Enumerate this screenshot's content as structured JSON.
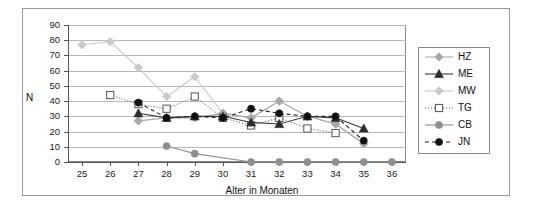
{
  "chart_data": {
    "type": "line",
    "title": "",
    "xlabel": "Alter in Monaten",
    "ylabel": "N",
    "x": [
      25,
      26,
      27,
      28,
      29,
      30,
      31,
      32,
      33,
      34,
      35,
      36
    ],
    "xlim": [
      24.5,
      36.5
    ],
    "ylim": [
      0,
      90
    ],
    "yticks": [
      0,
      10,
      20,
      30,
      40,
      50,
      60,
      70,
      80,
      90
    ],
    "xticks": [
      25,
      26,
      27,
      28,
      29,
      30,
      31,
      32,
      33,
      34,
      35,
      36
    ],
    "grid": "horizontal",
    "legend_position": "right",
    "series": [
      {
        "name": "HZ",
        "color": "#a8a8a8",
        "marker": "diamond",
        "marker_fill": "#a8a8a8",
        "line": "solid",
        "points": [
          {
            "x": 27,
            "y": 27
          },
          {
            "x": 28,
            "y": 29
          },
          {
            "x": 29,
            "y": 29
          },
          {
            "x": 30,
            "y": 32
          },
          {
            "x": 31,
            "y": 29
          },
          {
            "x": 32,
            "y": 40
          },
          {
            "x": 33,
            "y": 30
          },
          {
            "x": 34,
            "y": 25
          },
          {
            "x": 35,
            "y": 12
          }
        ]
      },
      {
        "name": "ME",
        "color": "#3a3a3a",
        "marker": "triangle",
        "marker_fill": "#2b2b2b",
        "line": "solid",
        "points": [
          {
            "x": 27,
            "y": 32
          },
          {
            "x": 28,
            "y": 29
          },
          {
            "x": 29,
            "y": 30
          },
          {
            "x": 30,
            "y": 30
          },
          {
            "x": 31,
            "y": 26
          },
          {
            "x": 32,
            "y": 25
          },
          {
            "x": 33,
            "y": 30
          },
          {
            "x": 34,
            "y": 29
          },
          {
            "x": 35,
            "y": 22
          }
        ]
      },
      {
        "name": "MW",
        "color": "#c9c9c9",
        "marker": "diamond",
        "marker_fill": "#c9c9c9",
        "line": "solid",
        "points": [
          {
            "x": 25,
            "y": 77
          },
          {
            "x": 26,
            "y": 79
          },
          {
            "x": 27,
            "y": 62
          },
          {
            "x": 28,
            "y": 43
          },
          {
            "x": 29,
            "y": 56
          },
          {
            "x": 30,
            "y": 32
          },
          {
            "x": 31,
            "y": 29
          },
          {
            "x": 32,
            "y": 40
          },
          {
            "x": 33,
            "y": 30
          },
          {
            "x": 34,
            "y": 25
          },
          {
            "x": 35,
            "y": 12
          }
        ]
      },
      {
        "name": "TG",
        "color": "#555555",
        "marker": "square-open",
        "marker_fill": "#ffffff",
        "line": "dotted",
        "points": [
          {
            "x": 26,
            "y": 44
          },
          {
            "x": 27,
            "y": 38
          },
          {
            "x": 28,
            "y": 35
          },
          {
            "x": 29,
            "y": 43
          },
          {
            "x": 30,
            "y": 29
          },
          {
            "x": 31,
            "y": 24
          },
          {
            "x": 32,
            "y": 29
          },
          {
            "x": 33,
            "y": 22
          },
          {
            "x": 34,
            "y": 19
          }
        ]
      },
      {
        "name": "CB",
        "color": "#8f8f8f",
        "marker": "circle",
        "marker_fill": "#8f8f8f",
        "line": "solid",
        "points": [
          {
            "x": 28,
            "y": 10.5
          },
          {
            "x": 29,
            "y": 5.5
          },
          {
            "x": 31,
            "y": 0
          },
          {
            "x": 32,
            "y": 0
          },
          {
            "x": 33,
            "y": 0
          },
          {
            "x": 34,
            "y": 0
          },
          {
            "x": 35,
            "y": 0
          },
          {
            "x": 36,
            "y": 0
          }
        ]
      },
      {
        "name": "JN",
        "color": "#222222",
        "marker": "circle",
        "marker_fill": "#111111",
        "line": "dashed",
        "points": [
          {
            "x": 27,
            "y": 39
          },
          {
            "x": 28,
            "y": 29
          },
          {
            "x": 29,
            "y": 30
          },
          {
            "x": 30,
            "y": 29
          },
          {
            "x": 31,
            "y": 35
          },
          {
            "x": 32,
            "y": 32
          },
          {
            "x": 33,
            "y": 30
          },
          {
            "x": 34,
            "y": 30
          },
          {
            "x": 35,
            "y": 14
          }
        ]
      }
    ]
  },
  "legend": {
    "items": [
      {
        "label": "HZ"
      },
      {
        "label": "ME"
      },
      {
        "label": "MW"
      },
      {
        "label": "TG"
      },
      {
        "label": "CB"
      },
      {
        "label": "JN"
      }
    ]
  }
}
